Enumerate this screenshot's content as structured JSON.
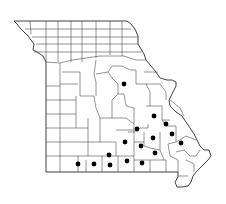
{
  "map": {
    "subject": "Missouri county distribution map",
    "state": "Missouri",
    "marker_symbol": "filled-circle",
    "marker_color": "#000000",
    "line_color": "#2a2a2a",
    "background_color": "#ffffff",
    "marked_county_count": 16,
    "marked_region_description": "Counties concentrated in the southeastern Ozarks and along the southern border, plus one central county"
  }
}
